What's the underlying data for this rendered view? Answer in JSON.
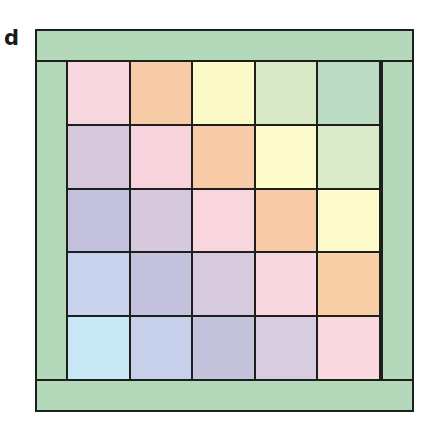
{
  "panel": {
    "label": "d"
  },
  "frame": {
    "band_color": "#b3d8ba",
    "line_color": "#1c1f1c"
  },
  "grid": {
    "rows": 5,
    "cols": 5,
    "cells": [
      [
        "#f6d6df",
        "#f8cba8",
        "#fdfac9",
        "#d9e9c8",
        "#bcdbc4"
      ],
      [
        "#d6c8dc",
        "#f8d3de",
        "#f8caa8",
        "#fdfbcb",
        "#daebc9"
      ],
      [
        "#c3c1dc",
        "#d6c9dd",
        "#f8d5df",
        "#f8caa8",
        "#fdfbcc"
      ],
      [
        "#c8d2ec",
        "#c3c1dc",
        "#d7cadf",
        "#f8d7e0",
        "#f9cfa8"
      ],
      [
        "#c9e8f6",
        "#c6d0ea",
        "#c4c3dc",
        "#d8cde0",
        "#f9d8df"
      ]
    ]
  }
}
